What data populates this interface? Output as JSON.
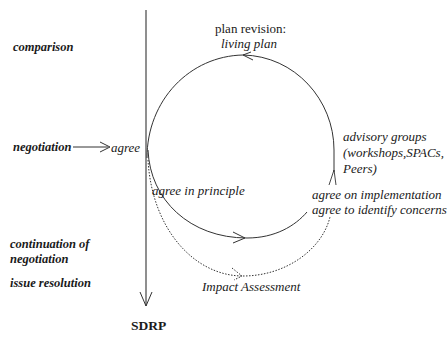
{
  "diagram": {
    "stages": [
      {
        "id": "comparison",
        "label": "comparison"
      },
      {
        "id": "negotiation",
        "label": "negotiation"
      },
      {
        "id": "continuation",
        "label_line1": "continuation of",
        "label_line2": "negotiation"
      },
      {
        "id": "issue-resolution",
        "label": "issue resolution"
      }
    ],
    "nodes": {
      "agree": "agree",
      "plan_revision": "plan revision:",
      "living_plan": "living plan",
      "advisory_line1": "advisory groups",
      "advisory_line2": "(workshops,SPACs,",
      "advisory_line3": "Peers)",
      "agree_in_principle": "agree in principle",
      "agree_on_implementation": "agree on implementation",
      "agree_to_identify": "agree to identify concerns",
      "impact_assessment": "Impact Assessment",
      "sdrp": "SDRP"
    },
    "colors": {
      "line": "#333333",
      "text": "#1a1a1a",
      "background": "#ffffff"
    }
  }
}
